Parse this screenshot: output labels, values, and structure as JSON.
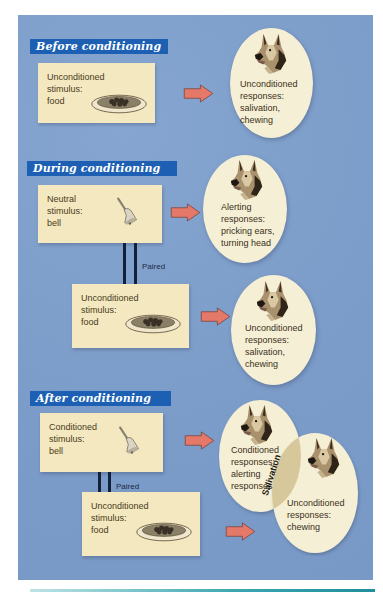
{
  "diagram": {
    "colors": {
      "panel": "#7f9fcb",
      "banner": "#1c5fb3",
      "stimulus_box": "#f3e8bf",
      "response_ellipse": "#f5efd6",
      "overlap": "#d6c89a",
      "arrow": "#e4796a",
      "paired_line": "#14203a"
    },
    "sections": [
      {
        "heading": "Before conditioning",
        "stimuli": [
          {
            "label": "Unconditioned\nstimulus:\nfood",
            "icon": "food-bowl-icon"
          }
        ],
        "responses": [
          {
            "label": "Unconditioned\nresponses:\nsalivation,\nchewing",
            "icon": "dog-head-icon"
          }
        ]
      },
      {
        "heading": "During conditioning",
        "stimuli": [
          {
            "label": "Neutral\nstimulus:\nbell",
            "icon": "bell-icon"
          },
          {
            "label": "Unconditioned\nstimulus:\nfood",
            "icon": "food-bowl-icon"
          }
        ],
        "link_label": "Paired",
        "responses": [
          {
            "label": "Alerting\nresponses:\npricking ears,\nturning head",
            "icon": "dog-head-icon"
          },
          {
            "label": "Unconditioned\nresponses:\nsalivation,\nchewing",
            "icon": "dog-head-icon"
          }
        ]
      },
      {
        "heading": "After conditioning",
        "stimuli": [
          {
            "label": "Conditioned\nstimulus:\nbell",
            "icon": "bell-icon"
          },
          {
            "label": "Unconditioned\nstimulus:\nfood",
            "icon": "food-bowl-icon"
          }
        ],
        "link_label": "Paired",
        "responses": [
          {
            "label": "Conditioned\nresponses:\nalerting\nresponses",
            "icon": "dog-head-icon"
          },
          {
            "label": "Unconditioned\nresponses:\nchewing",
            "icon": "dog-head-icon"
          }
        ],
        "overlap_label": "Salivation"
      }
    ]
  }
}
